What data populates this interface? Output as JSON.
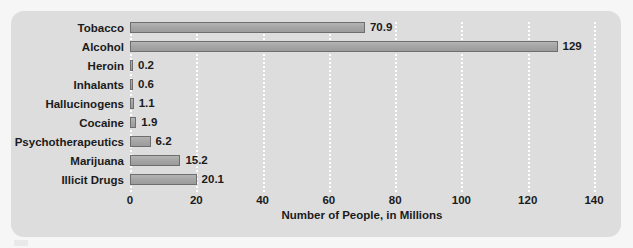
{
  "chart_data": {
    "type": "bar",
    "orientation": "horizontal",
    "title": "",
    "xlabel": "Number of People, in Millions",
    "ylabel": "",
    "xlim": [
      0,
      140
    ],
    "xticks": [
      0,
      20,
      40,
      60,
      80,
      100,
      120,
      140
    ],
    "xtick_labels": [
      "0",
      "20",
      "40",
      "60",
      "80",
      "100",
      "120",
      "140"
    ],
    "grid": true,
    "grid_style": "dotted-white-vertical",
    "legend": null,
    "categories": [
      "Tobacco",
      "Alcohol",
      "Heroin",
      "Inhalants",
      "Hallucinogens",
      "Cocaine",
      "Psychotherapeutics",
      "Marijuana",
      "Illicit Drugs"
    ],
    "values": [
      70.9,
      129,
      0.2,
      0.6,
      1.1,
      1.9,
      6.2,
      15.2,
      20.1
    ],
    "value_labels": [
      "70.9",
      "129",
      "0.2",
      "0.6",
      "1.1",
      "1.9",
      "6.2",
      "15.2",
      "20.1"
    ],
    "colors": {
      "bar_fill": "#a6a6a6",
      "bar_border": "#6e6e6e",
      "panel_background": "#dddddd",
      "page_background": "#f6f6f6",
      "gridline": "#ffffff",
      "text": "#1b1b1b"
    }
  }
}
